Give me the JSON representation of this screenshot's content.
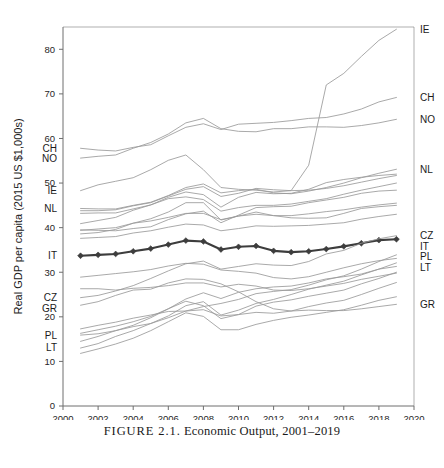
{
  "caption": {
    "prefix": "FIGURE 2.1.",
    "text": "Economic Output, 2001–2019",
    "full": "FIGURE 2.1. Economic Output, 2001–2019"
  },
  "colors": {
    "background": "#ffffff",
    "axis": "#6e6e6e",
    "series": "#9a9a9a",
    "highlight": "#3d3d3d",
    "text": "#1a1a1a"
  },
  "chart_data": {
    "type": "line",
    "title": "",
    "subtitle": "",
    "xlabel": "",
    "ylabel": "Real GDP per capita (2015 US $1,000s)",
    "xlim": [
      2000,
      2020
    ],
    "ylim": [
      0,
      85
    ],
    "xticks": [
      2000,
      2002,
      2004,
      2006,
      2008,
      2010,
      2012,
      2014,
      2016,
      2018,
      2020
    ],
    "yticks": [
      0,
      10,
      20,
      30,
      40,
      50,
      60,
      70,
      80
    ],
    "grid": false,
    "legend": "none",
    "legend_position": "inline-endpoint-labels",
    "x": [
      2001,
      2002,
      2003,
      2004,
      2005,
      2006,
      2007,
      2008,
      2009,
      2010,
      2011,
      2012,
      2013,
      2014,
      2015,
      2016,
      2017,
      2018,
      2019
    ],
    "highlight_series": "IT",
    "left_labels": [
      "CH",
      "NO",
      "IE",
      "NL",
      "IT",
      "GR",
      "CZ",
      "PL",
      "LT"
    ],
    "right_labels": [
      "IE",
      "CH",
      "NO",
      "NL",
      "IT",
      "CZ",
      "LT",
      "PL",
      "GR"
    ],
    "series": [
      {
        "name": "IE",
        "label_left": "IE",
        "label_right": "IE",
        "highlight": false,
        "values": [
          48.3,
          49.6,
          50.4,
          51.2,
          53.0,
          55.1,
          56.3,
          53.0,
          49.0,
          48.6,
          48.4,
          48.0,
          48.3,
          54.0,
          72.0,
          74.6,
          78.4,
          82.0,
          84.5
        ]
      },
      {
        "name": "CH",
        "label_left": "CH",
        "label_right": "CH",
        "highlight": false,
        "values": [
          57.8,
          57.4,
          57.2,
          58.0,
          58.6,
          60.6,
          62.5,
          63.3,
          62.0,
          63.2,
          63.4,
          63.6,
          64.0,
          64.5,
          64.7,
          65.5,
          66.6,
          68.2,
          69.2
        ]
      },
      {
        "name": "NO",
        "label_left": "NO",
        "label_right": "NO",
        "highlight": false,
        "values": [
          55.6,
          56.0,
          56.3,
          57.8,
          59.1,
          61.0,
          63.5,
          64.5,
          62.2,
          61.6,
          61.5,
          62.2,
          62.2,
          62.6,
          62.6,
          62.5,
          62.9,
          63.5,
          64.3
        ]
      },
      {
        "name": "NL",
        "label_left": "NL",
        "label_right": "NL",
        "highlight": false,
        "values": [
          44.3,
          44.2,
          44.2,
          45.0,
          45.7,
          47.2,
          49.0,
          49.8,
          47.8,
          48.3,
          48.6,
          47.8,
          47.6,
          48.2,
          49.0,
          50.0,
          51.2,
          52.2,
          53.1
        ]
      },
      {
        "name": "AT",
        "label_left": "",
        "label_right": "",
        "highlight": false,
        "values": [
          43.8,
          43.8,
          44.0,
          44.9,
          45.6,
          47.1,
          48.6,
          49.2,
          47.0,
          47.7,
          48.8,
          48.5,
          48.3,
          48.4,
          48.8,
          49.4,
          50.2,
          51.0,
          51.7
        ]
      },
      {
        "name": "DK",
        "label_left": "",
        "label_right": "",
        "highlight": false,
        "values": [
          43.2,
          43.3,
          43.3,
          44.2,
          45.1,
          46.5,
          46.9,
          46.3,
          43.7,
          44.5,
          45.0,
          45.0,
          45.3,
          45.9,
          46.5,
          47.5,
          48.4,
          49.2,
          50.0
        ]
      },
      {
        "name": "SE",
        "label_left": "",
        "label_right": "",
        "highlight": false,
        "values": [
          40.9,
          41.6,
          42.3,
          43.9,
          45.1,
          46.8,
          48.0,
          47.4,
          44.6,
          46.8,
          47.9,
          47.6,
          47.7,
          48.6,
          50.1,
          50.8,
          51.3,
          51.7,
          52.0
        ]
      },
      {
        "name": "DE",
        "label_left": "",
        "label_right": "",
        "highlight": false,
        "values": [
          39.5,
          39.4,
          39.3,
          39.8,
          40.2,
          41.8,
          43.1,
          43.7,
          41.1,
          42.8,
          44.5,
          44.7,
          44.8,
          45.6,
          46.2,
          46.8,
          47.7,
          48.2,
          48.4
        ]
      },
      {
        "name": "BE",
        "label_left": "",
        "label_right": "",
        "highlight": false,
        "values": [
          39.4,
          39.7,
          40.0,
          41.0,
          41.5,
          42.3,
          43.2,
          43.2,
          41.8,
          42.6,
          43.0,
          42.7,
          42.7,
          43.1,
          43.6,
          44.0,
          44.6,
          45.1,
          45.5
        ]
      },
      {
        "name": "FI",
        "label_left": "",
        "label_right": "",
        "highlight": false,
        "values": [
          38.6,
          38.9,
          39.6,
          41.0,
          42.0,
          43.5,
          45.6,
          45.6,
          41.7,
          42.6,
          43.5,
          42.7,
          42.2,
          42.1,
          42.2,
          43.2,
          44.3,
          44.7,
          45.0
        ]
      },
      {
        "name": "FR",
        "label_left": "",
        "label_right": "",
        "highlight": false,
        "values": [
          37.6,
          37.8,
          38.0,
          38.8,
          39.3,
          40.1,
          40.8,
          40.6,
          39.3,
          39.8,
          40.4,
          40.3,
          40.4,
          40.5,
          40.8,
          41.1,
          41.9,
          42.5,
          43.0
        ]
      },
      {
        "name": "IT",
        "label_left": "IT",
        "label_right": "IT",
        "highlight": true,
        "values": [
          33.7,
          33.9,
          34.1,
          34.7,
          35.3,
          36.2,
          37.1,
          36.9,
          35.1,
          35.7,
          35.9,
          34.8,
          34.5,
          34.7,
          35.2,
          35.8,
          36.5,
          37.2,
          37.4
        ]
      },
      {
        "name": "ES",
        "label_left": "",
        "label_right": "",
        "highlight": false,
        "values": [
          28.9,
          29.3,
          29.7,
          30.1,
          30.6,
          31.4,
          32.0,
          31.8,
          30.5,
          30.2,
          29.8,
          28.8,
          28.5,
          29.0,
          30.0,
          31.0,
          31.9,
          32.6,
          33.1
        ]
      },
      {
        "name": "CZ",
        "label_left": "CZ",
        "label_right": "CZ",
        "highlight": false,
        "values": [
          24.3,
          24.8,
          25.8,
          27.0,
          28.6,
          30.3,
          31.9,
          32.5,
          30.7,
          31.3,
          31.9,
          31.6,
          31.5,
          32.4,
          34.1,
          34.9,
          36.5,
          37.5,
          38.2
        ]
      },
      {
        "name": "PT",
        "label_left": "",
        "label_right": "",
        "highlight": false,
        "values": [
          26.3,
          26.3,
          26.0,
          26.4,
          26.6,
          27.0,
          27.6,
          27.6,
          26.7,
          27.3,
          26.9,
          26.0,
          25.9,
          26.3,
          26.9,
          27.5,
          28.4,
          29.1,
          29.8
        ]
      },
      {
        "name": "GR",
        "label_left": "GR",
        "label_right": "GR",
        "highlight": false,
        "values": [
          22.6,
          23.4,
          24.8,
          26.0,
          26.2,
          27.6,
          28.5,
          28.4,
          27.4,
          25.6,
          23.4,
          21.8,
          21.3,
          21.5,
          21.4,
          21.4,
          21.8,
          22.3,
          22.8
        ]
      },
      {
        "name": "SK",
        "label_left": "",
        "label_right": "",
        "highlight": false,
        "values": [
          16.3,
          17.1,
          17.9,
          18.9,
          20.1,
          21.8,
          24.0,
          25.4,
          24.1,
          25.5,
          26.3,
          26.7,
          26.9,
          27.6,
          28.5,
          29.0,
          29.6,
          30.7,
          31.3
        ]
      },
      {
        "name": "PL",
        "label_left": "PL",
        "label_right": "PL",
        "highlight": false,
        "values": [
          15.9,
          16.2,
          16.9,
          17.8,
          18.5,
          19.8,
          21.3,
          22.3,
          23.0,
          23.9,
          25.2,
          25.7,
          26.1,
          27.1,
          28.3,
          29.2,
          30.7,
          32.4,
          33.9
        ]
      },
      {
        "name": "LT",
        "label_left": "LT",
        "label_right": "LT",
        "highlight": false,
        "values": [
          13.0,
          14.0,
          15.6,
          16.9,
          18.5,
          20.2,
          22.5,
          23.4,
          20.4,
          21.5,
          23.0,
          23.9,
          25.0,
          26.2,
          27.1,
          28.0,
          29.4,
          30.7,
          32.1
        ]
      },
      {
        "name": "HU",
        "label_left": "",
        "label_right": "",
        "highlight": false,
        "values": [
          17.3,
          18.1,
          18.8,
          19.7,
          20.4,
          21.2,
          21.3,
          21.6,
          20.2,
          20.5,
          21.0,
          20.8,
          21.3,
          22.3,
          23.1,
          23.7,
          25.0,
          26.4,
          27.7
        ]
      },
      {
        "name": "EE",
        "label_left": "",
        "label_right": "",
        "highlight": false,
        "values": [
          14.5,
          15.6,
          16.9,
          18.1,
          19.8,
          21.8,
          23.5,
          22.5,
          19.6,
          20.5,
          22.4,
          23.3,
          23.8,
          24.6,
          25.3,
          26.0,
          27.4,
          28.6,
          30.0
        ]
      },
      {
        "name": "LV",
        "label_left": "",
        "label_right": "",
        "highlight": false,
        "values": [
          11.8,
          12.8,
          13.9,
          15.2,
          16.9,
          18.9,
          20.9,
          20.1,
          17.1,
          17.1,
          18.3,
          19.2,
          19.9,
          20.4,
          21.0,
          21.6,
          22.6,
          23.7,
          24.5
        ]
      }
    ]
  }
}
